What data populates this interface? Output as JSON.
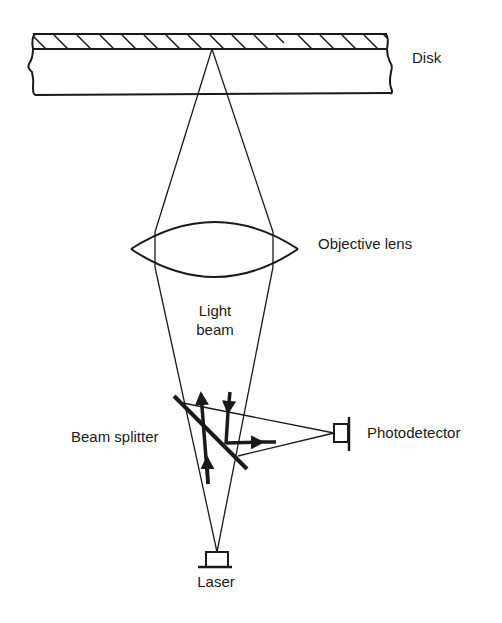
{
  "diagram": {
    "type": "optical-disk-readout-schematic",
    "labels": {
      "disk": "Disk",
      "objective_lens": "Objective lens",
      "light_beam_line1": "Light",
      "light_beam_line2": "beam",
      "beam_splitter": "Beam splitter",
      "photodetector": "Photodetector",
      "laser": "Laser"
    },
    "components": [
      {
        "id": "disk",
        "label": "Disk",
        "shape": "hatched-slab"
      },
      {
        "id": "objective-lens",
        "label": "Objective lens",
        "shape": "biconvex-lens"
      },
      {
        "id": "light-beam",
        "label": "Light beam",
        "shape": "converging-cone"
      },
      {
        "id": "beam-splitter",
        "label": "Beam splitter",
        "shape": "diagonal-plate"
      },
      {
        "id": "photodetector",
        "label": "Photodetector",
        "shape": "detector-box"
      },
      {
        "id": "laser",
        "label": "Laser",
        "shape": "source-box"
      }
    ],
    "flows": [
      {
        "from": "laser",
        "to": "beam-splitter",
        "direction": "up"
      },
      {
        "from": "beam-splitter",
        "to": "objective-lens",
        "direction": "up"
      },
      {
        "from": "objective-lens",
        "to": "disk",
        "direction": "focus"
      },
      {
        "from": "disk",
        "to": "beam-splitter",
        "direction": "down (reflected)"
      },
      {
        "from": "beam-splitter",
        "to": "photodetector",
        "direction": "right"
      }
    ],
    "colors": {
      "stroke": "#1a1a1a",
      "background": "#ffffff"
    }
  }
}
